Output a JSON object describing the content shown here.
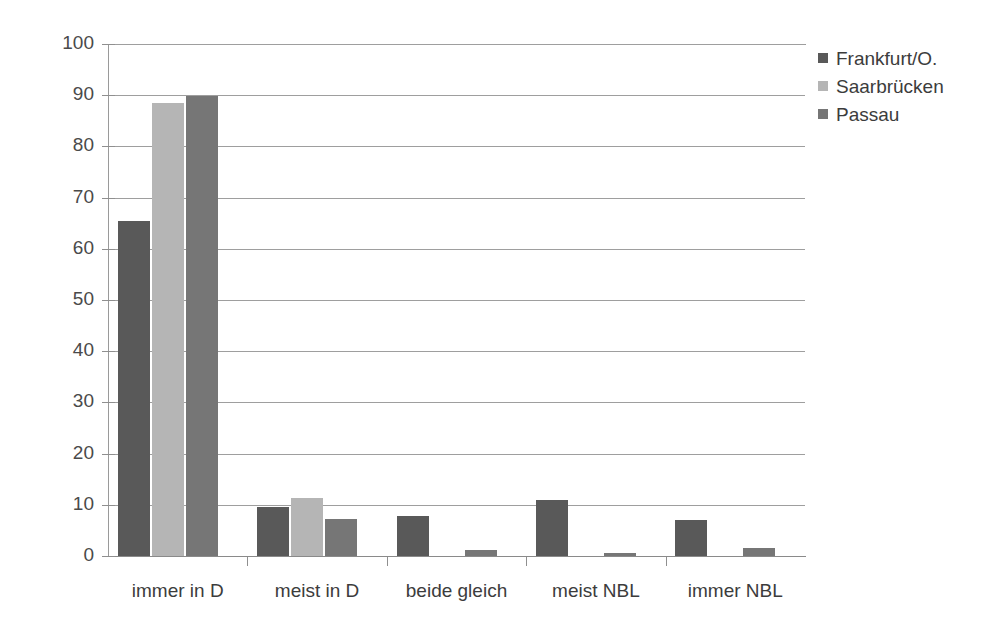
{
  "chart_data": {
    "type": "bar",
    "title": "",
    "subtitle": "",
    "xlabel": "",
    "ylabel": "",
    "categories": [
      "immer in D",
      "meist in D",
      "beide gleich",
      "meist NBL",
      "immer NBL"
    ],
    "series": [
      {
        "name": "Frankfurt/O.",
        "color": "#595959",
        "values": [
          65.5,
          9.5,
          7.8,
          11.0,
          7.0
        ]
      },
      {
        "name": "Saarbrücken",
        "color": "#b5b5b5",
        "values": [
          88.5,
          11.3,
          0,
          0,
          0
        ]
      },
      {
        "name": "Passau",
        "color": "#767676",
        "values": [
          89.8,
          7.3,
          1.2,
          0.6,
          1.5
        ]
      }
    ],
    "ylim": [
      0,
      100
    ],
    "ytick_values": [
      0,
      10,
      20,
      30,
      40,
      50,
      60,
      70,
      80,
      90,
      100
    ],
    "ytick_labels": [
      "0",
      "10",
      "20",
      "30",
      "40",
      "50",
      "60",
      "70",
      "80",
      "90",
      "100"
    ],
    "grid": true,
    "grid_axis": "y",
    "legend_position": "right",
    "bar_group_mode": "grouped"
  },
  "axis": {
    "y": {
      "labels": [
        "100",
        "90",
        "80",
        "70",
        "60",
        "50",
        "40",
        "30",
        "20",
        "10",
        "0"
      ]
    },
    "x": {
      "labels": [
        "immer in D",
        "meist in D",
        "beide gleich",
        "meist NBL",
        "immer NBL"
      ]
    }
  },
  "legend": {
    "items": [
      {
        "label": "Frankfurt/O.",
        "swatch": "legend-swatch-frankfurt"
      },
      {
        "label": "Saarbrücken",
        "swatch": "legend-swatch-saarbruecken"
      },
      {
        "label": "Passau",
        "swatch": "legend-swatch-passau"
      }
    ]
  },
  "colors": {
    "series_1": "#595959",
    "series_2": "#b5b5b5",
    "series_3": "#767676",
    "gridline": "#9e9e9e",
    "axis": "#8f8f8f",
    "text": "#3c3c3c",
    "background": "#ffffff"
  }
}
